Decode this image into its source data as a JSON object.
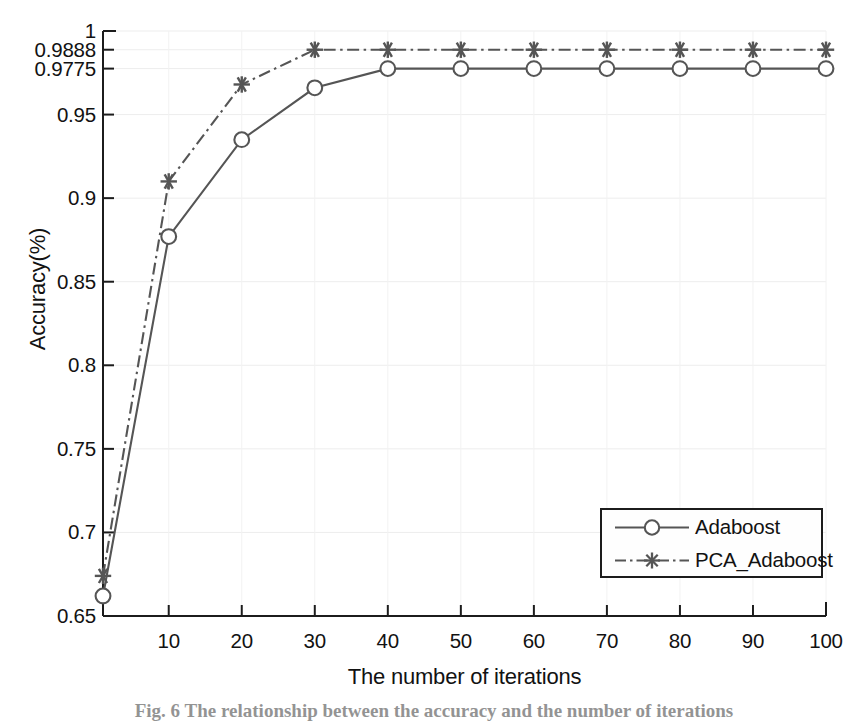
{
  "figure": {
    "caption_label": "Fig. 6",
    "caption_text": "The relationship between the accuracy and the number of iterations"
  },
  "chart_data": {
    "type": "line",
    "title": "",
    "xlabel": "The number of iterations",
    "ylabel": "Accuracy(%)",
    "xlim": [
      1,
      100
    ],
    "ylim": [
      0.65,
      1.0
    ],
    "grid": true,
    "legend_position": "lower right",
    "xticks": [
      10,
      20,
      30,
      40,
      50,
      60,
      70,
      80,
      90,
      100
    ],
    "xtick_labels": [
      "10",
      "20",
      "30",
      "40",
      "50",
      "60",
      "70",
      "80",
      "90",
      "100"
    ],
    "yticks": [
      0.65,
      0.7,
      0.75,
      0.8,
      0.85,
      0.9,
      0.95,
      0.9775,
      0.9888,
      1
    ],
    "ytick_labels": [
      "0.65",
      "0.7",
      "0.75",
      "0.8",
      "0.85",
      "0.9",
      "0.95",
      "0.9775",
      "0.9888",
      "1"
    ],
    "x": [
      1,
      10,
      20,
      30,
      40,
      50,
      60,
      70,
      80,
      90,
      100
    ],
    "series": [
      {
        "name": "Adaboost",
        "color": "#555555",
        "linestyle": "solid",
        "marker": "circle",
        "values": [
          0.662,
          0.877,
          0.935,
          0.966,
          0.9775,
          0.9775,
          0.9775,
          0.9775,
          0.9775,
          0.9775,
          0.9775
        ]
      },
      {
        "name": "PCA_Adaboost",
        "color": "#555555",
        "linestyle": "dashdot",
        "marker": "asterisk",
        "values": [
          0.674,
          0.91,
          0.968,
          0.9888,
          0.9888,
          0.9888,
          0.9888,
          0.9888,
          0.9888,
          0.9888,
          0.9888
        ]
      }
    ]
  },
  "legend": {
    "items": [
      {
        "label": "Adaboost"
      },
      {
        "label": "PCA_Adaboost"
      }
    ]
  }
}
